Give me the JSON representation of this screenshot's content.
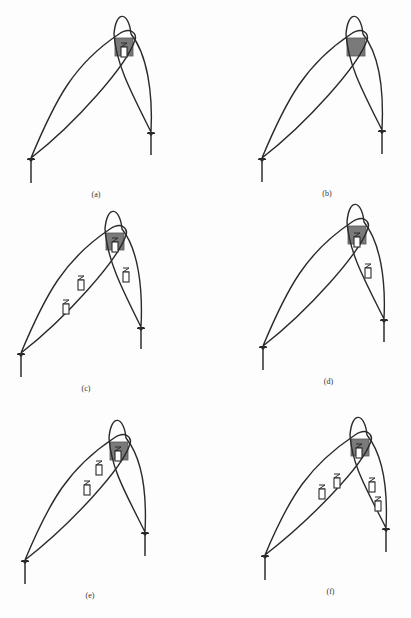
{
  "figure": {
    "panels": [
      {
        "label": "(a)",
        "left_antenna": {
          "x": 31,
          "y": 158,
          "pole_bottom": 183
        },
        "right_antenna": {
          "x": 151,
          "y": 132,
          "pole_bottom": 155
        },
        "shaded_area": {
          "x": 115,
          "y": 38,
          "w": 18,
          "h": 18
        },
        "devices": [
          {
            "x": 124,
            "y": 50
          }
        ]
      },
      {
        "label": "(b)",
        "left_antenna": {
          "x": 262,
          "y": 158,
          "pole_bottom": 182
        },
        "right_antenna": {
          "x": 382,
          "y": 130,
          "pole_bottom": 154
        },
        "shaded_area": {
          "x": 347,
          "y": 38,
          "w": 18,
          "h": 18
        },
        "devices": []
      },
      {
        "label": "(c)",
        "left_antenna": {
          "x": 21,
          "y": 353,
          "pole_bottom": 377
        },
        "right_antenna": {
          "x": 141,
          "y": 327,
          "pole_bottom": 349
        },
        "shaded_area": {
          "x": 106,
          "y": 233,
          "w": 18,
          "h": 17
        },
        "devices": [
          {
            "x": 115,
            "y": 245
          },
          {
            "x": 81,
            "y": 283
          },
          {
            "x": 126,
            "y": 275
          },
          {
            "x": 66,
            "y": 307
          }
        ]
      },
      {
        "label": "(d)",
        "left_antenna": {
          "x": 263,
          "y": 346,
          "pole_bottom": 370
        },
        "right_antenna": {
          "x": 384,
          "y": 319,
          "pole_bottom": 342
        },
        "shaded_area": {
          "x": 348,
          "y": 226,
          "w": 18,
          "h": 18
        },
        "devices": [
          {
            "x": 357,
            "y": 240
          },
          {
            "x": 368,
            "y": 271
          }
        ]
      },
      {
        "label": "(e)",
        "left_antenna": {
          "x": 25,
          "y": 560,
          "pole_bottom": 584
        },
        "right_antenna": {
          "x": 145,
          "y": 532,
          "pole_bottom": 556
        },
        "shaded_area": {
          "x": 110,
          "y": 442,
          "w": 18,
          "h": 18
        },
        "devices": [
          {
            "x": 118,
            "y": 454
          },
          {
            "x": 99,
            "y": 468
          },
          {
            "x": 87,
            "y": 488
          }
        ]
      },
      {
        "label": "(f)",
        "left_antenna": {
          "x": 265,
          "y": 555,
          "pole_bottom": 580
        },
        "right_antenna": {
          "x": 386,
          "y": 528,
          "pole_bottom": 552
        },
        "shaded_area": {
          "x": 351,
          "y": 439,
          "w": 18,
          "h": 17
        },
        "devices": [
          {
            "x": 359,
            "y": 451
          },
          {
            "x": 337,
            "y": 481
          },
          {
            "x": 322,
            "y": 492
          },
          {
            "x": 372,
            "y": 485
          },
          {
            "x": 378,
            "y": 504
          }
        ]
      }
    ]
  },
  "colors": {
    "line": "#2a2a2a",
    "shaded_area": "#7a7a7a",
    "background": "#fdfdfd"
  }
}
